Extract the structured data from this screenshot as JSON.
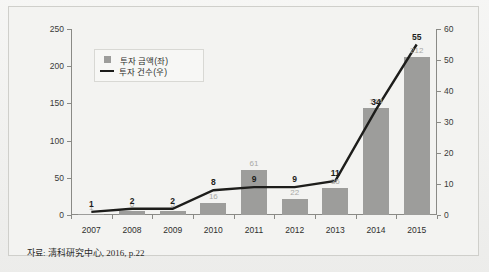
{
  "footnote": "자료: 淸科硏究中心, 2016, p.22",
  "legend": {
    "items": [
      {
        "label": "투자 금액(좌)",
        "marker": "square-swatch",
        "color": "#9d9d9b"
      },
      {
        "label": "투자 건수(우)",
        "marker": "line-swatch",
        "color": "#1d1d1b"
      }
    ]
  },
  "chart_data": {
    "type": "bar",
    "title": "",
    "subtitle": "",
    "xlabel": "",
    "ylabel": "",
    "grid": false,
    "legend_position": "top-left-inside",
    "categories": [
      "2007",
      "2008",
      "2009",
      "2010",
      "2011",
      "2012",
      "2013",
      "2014",
      "2015"
    ],
    "series": [
      {
        "name": "투자 금액(좌)",
        "type": "bar",
        "axis": "left",
        "color": "#9d9d9b",
        "values": [
          1,
          6,
          5,
          16,
          61,
          22,
          36,
          144,
          212
        ]
      },
      {
        "name": "투자 건수(우)",
        "type": "line",
        "axis": "right",
        "color": "#1d1d1b",
        "values": [
          1,
          2,
          2,
          8,
          9,
          9,
          11,
          34,
          55
        ]
      }
    ],
    "left_axis": {
      "ticks": [
        0,
        50,
        100,
        150,
        200,
        250
      ],
      "ylim": [
        0,
        250
      ]
    },
    "right_axis": {
      "ticks": [
        0,
        10,
        20,
        30,
        40,
        50,
        60
      ],
      "ylim": [
        0,
        60
      ]
    }
  }
}
